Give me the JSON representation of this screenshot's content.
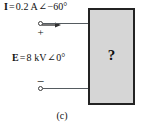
{
  "figure": {
    "caption": "(c)"
  },
  "current_source": {
    "symbol": "I",
    "equals": "=",
    "magnitude": "0.2 A",
    "angle_symbol": "∠",
    "phase": "−60°",
    "full_text": "I = 0.2 A ∠ −60°",
    "arrow_icon": "current-direction-arrow-right"
  },
  "voltage_source": {
    "symbol": "E",
    "equals": "=",
    "magnitude": "8 kV",
    "angle_symbol": "∠",
    "phase": "0°",
    "full_text": "E = 8 kV ∠ 0°"
  },
  "terminals": {
    "top": {
      "polarity": "+",
      "node_icon": "open-circle-terminal"
    },
    "bottom": {
      "polarity": "−",
      "node_icon": "open-circle-terminal"
    }
  },
  "network_box": {
    "label": "?"
  },
  "colors": {
    "box_fill": "#d6d6d6",
    "box_border": "#232323",
    "wire": "#555b60",
    "text": "#111111",
    "background": "#ffffff"
  }
}
